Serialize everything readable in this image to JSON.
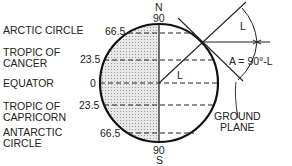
{
  "labels": {
    "arctic": "ARCTIC CIRCLE",
    "cancer": "TROPIC OF\nCANCER",
    "equator": "EQUATOR",
    "capricorn": "TROPIC OF\nCAPRICORN",
    "antarctic": "ANTARCTIC\nCIRCLE",
    "ground": "GROUND\nPLANE",
    "formula": "A = 90°-L",
    "L_top": "L",
    "L_center": "L",
    "N": "N",
    "S": "S",
    "n90": "90",
    "s90": "90"
  },
  "latitudes": [
    "66.5",
    "23.5",
    "0",
    "23.5",
    "66.5"
  ]
}
